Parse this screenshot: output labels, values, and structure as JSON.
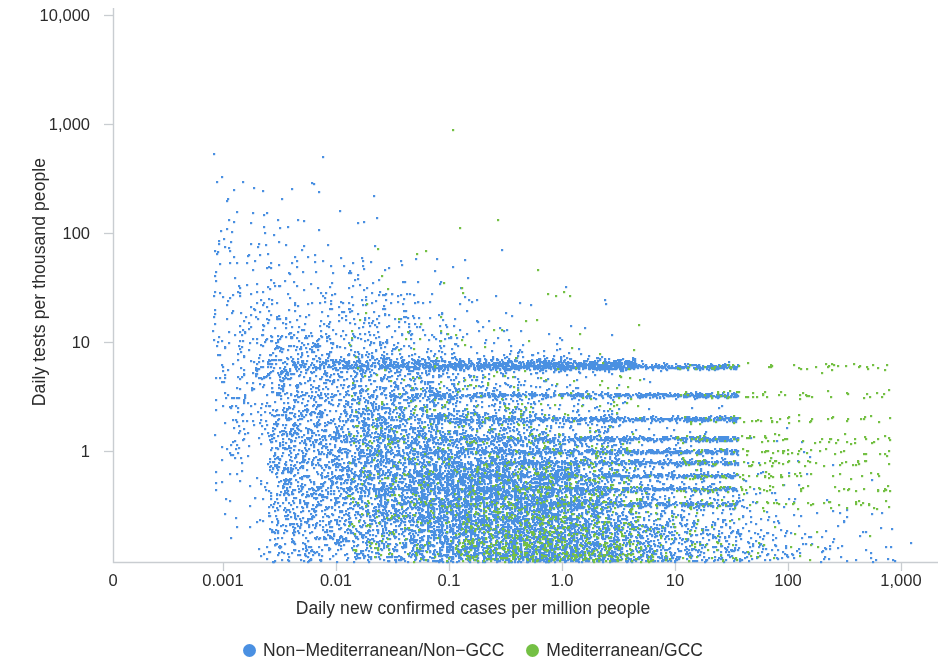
{
  "chart_data": {
    "type": "scatter",
    "title": "",
    "xlabel": "Daily new confirmed cases per million people",
    "ylabel": "Daily tests per thousand people",
    "xscale": "log",
    "yscale": "log",
    "grid": false,
    "legend_position": "bottom-center",
    "xlim": [
      0.0003,
      2000
    ],
    "ylim": [
      0.13,
      14000
    ],
    "xticks": [
      {
        "label": "0",
        "value": 0,
        "px": 113
      },
      {
        "label": "0.001",
        "value": 0.001,
        "px": 223
      },
      {
        "label": "0.01",
        "value": 0.01,
        "px": 336
      },
      {
        "label": "0.1",
        "value": 0.1,
        "px": 449
      },
      {
        "label": "1.0",
        "value": 1.0,
        "px": 562
      },
      {
        "label": "10",
        "value": 10,
        "px": 675
      },
      {
        "label": "100",
        "value": 100,
        "px": 788
      },
      {
        "label": "1,000",
        "value": 1000,
        "px": 901
      }
    ],
    "yticks": [
      {
        "label": "10,000",
        "value": 10000,
        "px": 15
      },
      {
        "label": "1,000",
        "value": 1000,
        "px": 124
      },
      {
        "label": "100",
        "value": 100,
        "px": 233
      },
      {
        "label": "10",
        "value": 10,
        "px": 342
      },
      {
        "label": "1",
        "value": 1,
        "px": 451
      }
    ],
    "series": [
      {
        "name": "Non−Mediterranean/Non−GCC",
        "color": "#4a90e2",
        "point_count": 58000,
        "marker": "circle",
        "marker_size": 2.2,
        "description": "Broad diffuse cloud spanning 0.0005 to 2000 cases/million and 0.15 to 10000 tests/thousand; positive log-log correlation; discrete horizontal bands at low test rates; extends further left and lower than the green series."
      },
      {
        "name": "Mediterranean/GCC",
        "color": "#74c044",
        "point_count": 22000,
        "marker": "circle",
        "marker_size": 2.2,
        "description": "Concentrated at higher case and test rates, 0.05 to 1500 cases/million and 1 to 10000 tests/thousand; forms filament-like trajectory arcs near the top of the panel above 3000 tests/thousand."
      }
    ],
    "annotations": []
  },
  "legend": {
    "entries": [
      {
        "label": "Non−Mediterranean/Non−GCC",
        "color": "#4a90e2"
      },
      {
        "label": "Mediterranean/GCC",
        "color": "#74c044"
      }
    ]
  },
  "style": {
    "axis_color": "#c9cdd1",
    "text_color": "#2b2b2b",
    "background": "#ffffff"
  }
}
